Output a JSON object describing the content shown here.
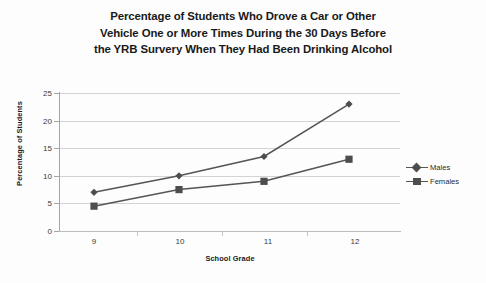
{
  "chart_data": {
    "type": "line",
    "title": "Percentage of Students Who Drove a Car or Other Vehicle One or More Times During the 30 Days Before the YRB Survery When They Had Been Drinking Alcohol",
    "title_lines": [
      "Percentage of Students Who Drove a Car or Other",
      "Vehicle One or More Times During the 30 Days Before",
      "the YRB Survery When They Had Been Drinking Alcohol"
    ],
    "xlabel": "School Grade",
    "ylabel": "Percentage of Students",
    "categories": [
      "9",
      "10",
      "11",
      "12"
    ],
    "series": [
      {
        "name": "Males",
        "marker": "diamond",
        "color": "#4d4d4d",
        "values": [
          7,
          10,
          13.5,
          23
        ]
      },
      {
        "name": "Females",
        "marker": "square",
        "color": "#4d4d4d",
        "values": [
          4.5,
          7.5,
          9,
          13
        ]
      }
    ],
    "ylim": [
      0,
      25
    ],
    "ytick_values": [
      0,
      5,
      10,
      15,
      20,
      25
    ],
    "ytick_labels": [
      "0",
      "5",
      "10",
      "15",
      "20",
      "25"
    ],
    "grid": "horizontal",
    "legend_position": "right",
    "gridline_color": "#d3d3d3",
    "line_color": "#555555",
    "background_color": "#ffffff"
  },
  "legend": {
    "entries": [
      {
        "label": "Males"
      },
      {
        "label": "Females"
      }
    ]
  }
}
